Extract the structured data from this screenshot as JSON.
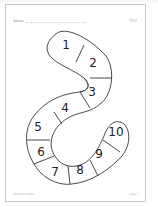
{
  "worksheet": {
    "name_label": "Name",
    "reference": "PS3",
    "footer_left": "PRIMARY SERIES",
    "footer_right": "Page 1"
  },
  "snake": {
    "segments": [
      {
        "label": "1"
      },
      {
        "label": "2"
      },
      {
        "label": "3"
      },
      {
        "label": "4"
      },
      {
        "label": "5"
      },
      {
        "label": "6"
      },
      {
        "label": "7"
      },
      {
        "label": "8"
      },
      {
        "label": "9"
      },
      {
        "label": "10"
      }
    ],
    "stroke_color": "#333333"
  }
}
